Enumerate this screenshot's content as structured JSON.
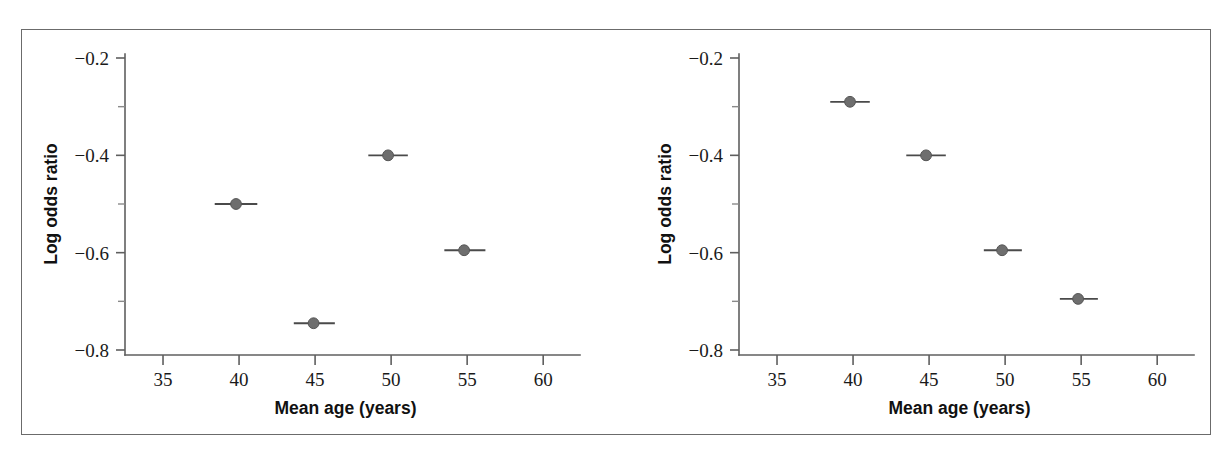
{
  "figure": {
    "background": "#ffffff",
    "frame_color": "#6b6b6b",
    "marker_color": "#6e6e6e",
    "whisker_color": "#4a4a4a",
    "axis_color": "#5f5f5f",
    "panel_count": 2
  },
  "axis_titles": {
    "x": "Mean age (years)",
    "y": "Log odds ratio"
  },
  "x_ticks": [
    "35",
    "40",
    "45",
    "50",
    "55",
    "60"
  ],
  "y_ticks": [
    "-0.2",
    "-0.4",
    "-0.6",
    "-0.8"
  ],
  "y_ticks_display": [
    "−0.2",
    "−0.4",
    "−0.6",
    "−0.8"
  ],
  "y_minor_ticks": [
    "-0.3",
    "-0.5",
    "-0.7"
  ],
  "chart_data": [
    {
      "type": "scatter",
      "panel": "left",
      "title": "",
      "xlabel": "Mean age (years)",
      "ylabel": "Log odds ratio",
      "xlim": [
        32.5,
        61.5
      ],
      "ylim": [
        -0.82,
        -0.18
      ],
      "xticks": [
        35,
        40,
        45,
        50,
        55,
        60
      ],
      "yticks": [
        -0.2,
        -0.4,
        -0.6,
        -0.8
      ],
      "yminorticks": [
        -0.3,
        -0.5,
        -0.7
      ],
      "grid": false,
      "legend": "none",
      "error_bars": "horizontal",
      "points": [
        {
          "x": 39.8,
          "y": -0.5,
          "xerr_low": 38.4,
          "xerr_high": 41.2
        },
        {
          "x": 44.9,
          "y": -0.745,
          "xerr_low": 43.6,
          "xerr_high": 46.3
        },
        {
          "x": 49.8,
          "y": -0.4,
          "xerr_low": 48.5,
          "xerr_high": 51.1
        },
        {
          "x": 54.8,
          "y": -0.595,
          "xerr_low": 53.5,
          "xerr_high": 56.2
        }
      ]
    },
    {
      "type": "scatter",
      "panel": "right",
      "title": "",
      "xlabel": "Mean age (years)",
      "ylabel": "Log odds ratio",
      "xlim": [
        32.5,
        61.5
      ],
      "ylim": [
        -0.82,
        -0.18
      ],
      "xticks": [
        35,
        40,
        45,
        50,
        55,
        60
      ],
      "yticks": [
        -0.2,
        -0.4,
        -0.6,
        -0.8
      ],
      "yminorticks": [
        -0.3,
        -0.5,
        -0.7
      ],
      "grid": false,
      "legend": "none",
      "error_bars": "horizontal",
      "points": [
        {
          "x": 39.8,
          "y": -0.29,
          "xerr_low": 38.5,
          "xerr_high": 41.1
        },
        {
          "x": 44.8,
          "y": -0.4,
          "xerr_low": 43.5,
          "xerr_high": 46.1
        },
        {
          "x": 49.8,
          "y": -0.595,
          "xerr_low": 48.6,
          "xerr_high": 51.1
        },
        {
          "x": 54.8,
          "y": -0.695,
          "xerr_low": 53.6,
          "xerr_high": 56.1
        }
      ]
    }
  ]
}
